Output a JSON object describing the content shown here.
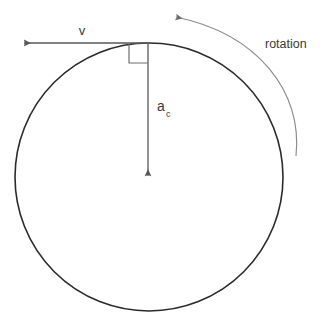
{
  "diagram": {
    "type": "physics-vector-diagram",
    "canvas": {
      "width": 329,
      "height": 325,
      "background": "#ffffff"
    },
    "colors": {
      "circle_stroke": "#2b2b2b",
      "vector_stroke": "#595959",
      "arc_stroke": "#8a8a8a",
      "right_angle_stroke": "#6e6e6e",
      "text": "#3a3a3a"
    },
    "circle": {
      "label": "circular path",
      "center_x": 149,
      "center_y": 177,
      "radius": 134,
      "stroke_width": 1.6,
      "fill": "none"
    },
    "tangent_point": {
      "x": 148,
      "y": 43
    },
    "velocity_vector": {
      "label": "v",
      "description": "tangential velocity vector pointing left",
      "from_x": 148,
      "from_y": 43,
      "to_x": 20,
      "to_y": 43,
      "direction": "left",
      "label_x": 82,
      "label_y": 35
    },
    "acceleration_vector": {
      "label": "a",
      "subscript": "c",
      "description": "centripetal acceleration vector pointing down toward center",
      "from_x": 148,
      "from_y": 43,
      "to_x": 148,
      "to_y": 180,
      "direction": "down",
      "label_x": 157,
      "label_y": 111,
      "subscript_x": 167,
      "subscript_y": 117
    },
    "right_angle_marker": {
      "label": "right angle between v and a_c",
      "x": 128,
      "y": 44,
      "size": 19
    },
    "rotation_arc": {
      "label": "rotation",
      "description": "curved arrow indicating counterclockwise rotation",
      "start_x": 296,
      "start_y": 156,
      "end_x": 172,
      "end_y": 17,
      "control_x": 300,
      "control_y": 40,
      "direction": "counterclockwise",
      "label_x": 265,
      "label_y": 48
    }
  }
}
